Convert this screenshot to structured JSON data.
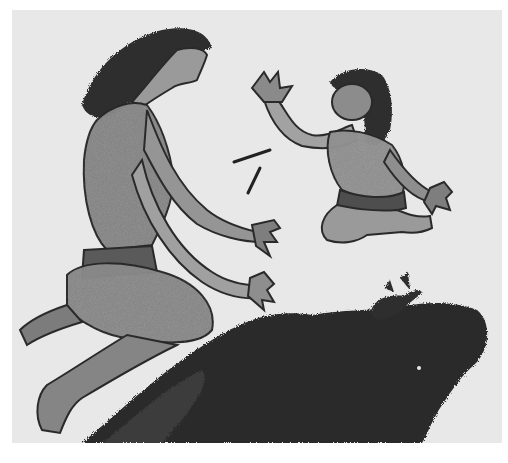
{
  "artwork": {
    "description": "Grayscale ink-wash illustration: a long-haired kneeling figure reaching toward a child figure floating mid-air, two small sticks between them, a small crab, and a large dark rock mass at the bottom.",
    "elements": [
      {
        "id": "adult-figure",
        "label": "Kneeling long-haired figure"
      },
      {
        "id": "child-figure",
        "label": "Floating child figure with raised hands"
      },
      {
        "id": "sticks",
        "label": "Two small sticks"
      },
      {
        "id": "crab",
        "label": "Small crab"
      },
      {
        "id": "rock",
        "label": "Large dark rock mass"
      }
    ]
  },
  "colors": {
    "page_background": "#ffffff",
    "paper": "#e8e8e8",
    "skin_tone": "#8a8a8a",
    "skin_light": "#a8a8a8",
    "outline": "#2a2a2a",
    "hair": "#2e2e2e",
    "rock": "#2b2b2b"
  }
}
